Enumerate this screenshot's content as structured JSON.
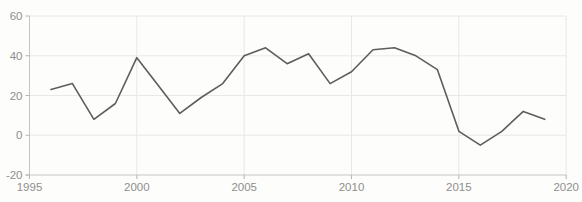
{
  "chart_data": {
    "type": "line",
    "title": "",
    "xlabel": "",
    "ylabel": "",
    "legend": "none",
    "grid": true,
    "x": [
      1996,
      1997,
      1998,
      1999,
      2000,
      2001,
      2002,
      2003,
      2004,
      2005,
      2006,
      2007,
      2008,
      2009,
      2010,
      2011,
      2012,
      2013,
      2014,
      2015,
      2016,
      2017,
      2018,
      2019
    ],
    "values": [
      23,
      26,
      8,
      16,
      39,
      25,
      11,
      19,
      26,
      40,
      44,
      36,
      41,
      26,
      32,
      43,
      44,
      40,
      33,
      2,
      -5,
      2,
      12,
      8
    ],
    "xlim": [
      1995,
      2020
    ],
    "ylim": [
      -20,
      60
    ],
    "x_ticks": [
      {
        "v": 1995,
        "label": "1995"
      },
      {
        "v": 2000,
        "label": "2000"
      },
      {
        "v": 2005,
        "label": "2005"
      },
      {
        "v": 2010,
        "label": "2010"
      },
      {
        "v": 2015,
        "label": "2015"
      },
      {
        "v": 2020,
        "label": "2020"
      }
    ],
    "y_ticks": [
      {
        "v": -20,
        "label": "-20"
      },
      {
        "v": 0,
        "label": "0"
      },
      {
        "v": 20,
        "label": "20"
      },
      {
        "v": 40,
        "label": "40"
      },
      {
        "v": 60,
        "label": "60"
      }
    ],
    "colors": {
      "line": "#5d5d5d",
      "grid": "#e9e8e6",
      "axis": "#c6c5c3",
      "tick": "#b5b4b2",
      "label": "#8f8e8c",
      "background": "#fdfdfc"
    }
  }
}
